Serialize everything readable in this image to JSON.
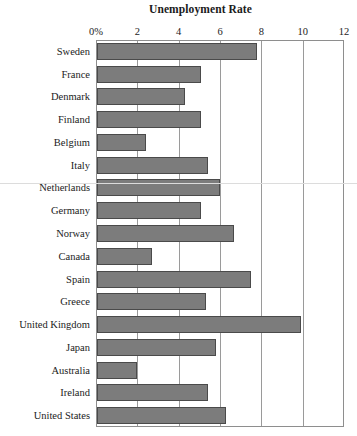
{
  "chart_data": {
    "type": "bar",
    "orientation": "horizontal",
    "title": "Unemployment Rate",
    "xlabel": "",
    "ylabel": "",
    "xlim": [
      0,
      12
    ],
    "xticks": [
      "0%",
      "2",
      "4",
      "6",
      "8",
      "10",
      "12"
    ],
    "xtick_values": [
      0,
      2,
      4,
      6,
      8,
      10,
      12
    ],
    "grid": true,
    "legend": false,
    "bar_color": "#7c7c7c",
    "bar_border_color": "#4a4a4a",
    "categories": [
      "Sweden",
      "France",
      "Denmark",
      "Finland",
      "Belgium",
      "Italy",
      "Netherlands",
      "Germany",
      "Norway",
      "Canada",
      "Spain",
      "Greece",
      "United Kingdom",
      "Japan",
      "Australia",
      "Ireland",
      "United States"
    ],
    "values": [
      7.8,
      5.1,
      4.3,
      5.1,
      2.4,
      5.4,
      6.0,
      5.1,
      6.7,
      2.7,
      7.5,
      5.3,
      9.9,
      5.8,
      2.0,
      5.4,
      6.3
    ]
  }
}
